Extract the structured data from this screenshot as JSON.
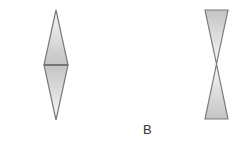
{
  "figure": {
    "label": "B",
    "shapes": [
      {
        "name": "diamond",
        "description": "two triangles joined at their bases (vertical rhombus)"
      },
      {
        "name": "hourglass",
        "description": "two triangles joined at their apexes"
      }
    ],
    "colors": {
      "stroke": "#7a7a7a",
      "fill_light": "#f4f4f4",
      "fill_dark": "#c8c8c8"
    }
  }
}
